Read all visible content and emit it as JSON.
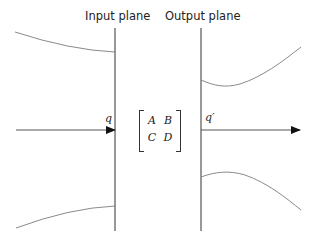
{
  "labels": {
    "input_plane": "Input plane",
    "output_plane": "Output plane",
    "q_in": "q",
    "q_out": "q′"
  },
  "matrix": {
    "a": "A",
    "b": "B",
    "c": "C",
    "d": "D"
  },
  "colors": {
    "line": "#333333",
    "curve": "#8a8a8a",
    "background": "#ffffff"
  }
}
